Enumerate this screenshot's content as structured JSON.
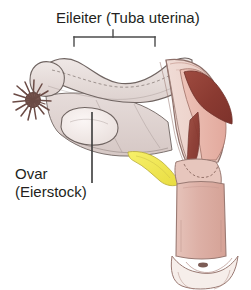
{
  "figure": {
    "width": 251,
    "height": 290,
    "background": "#ffffff",
    "language": "de"
  },
  "labels": {
    "tube": {
      "text": "Eileiter (Tuba uterina)",
      "term": "Eileiter",
      "latin": "Tuba uterina",
      "color": "#231f20",
      "x": 56,
      "y": 9,
      "font_size_px": 15
    },
    "ovary": {
      "line1": "Ovar",
      "line2": "(Eierstock)",
      "term": "Ovar",
      "german": "Eierstock",
      "color": "#231f20",
      "x": 15,
      "y": 165,
      "font_size_px": 15
    }
  },
  "leaders": {
    "tube_bracket": {
      "name": "span-bracket",
      "x_left": 74,
      "x_right": 155,
      "y_bar": 37,
      "tick_height": 9,
      "stem_x": 113,
      "stem_top": 30,
      "color": "#4b4b4b",
      "width_px": 1.4
    },
    "ovary_pointer": {
      "name": "leader-line",
      "x": 92,
      "y_top": 112,
      "y_bottom": 183,
      "color": "#3a3a3a",
      "width_px": 1.6
    }
  },
  "anatomy": {
    "parts": [
      {
        "name": "fallopian-tube",
        "label": "Eileiter (Tuba uterina)",
        "fill": "#e4dad8",
        "stroke": "#6f6461"
      },
      {
        "name": "fimbriae",
        "label": "Fimbrien",
        "fill": "#7c5c55",
        "stroke": "#5d433d"
      },
      {
        "name": "ovary",
        "label": "Ovar (Eierstock)",
        "fill": "#f0e8e6",
        "stroke": "#6f6461"
      },
      {
        "name": "broad-ligament",
        "label": "Ligamentum latum",
        "fill": "#ddd0ce",
        "stroke": "#6f6461"
      },
      {
        "name": "uterus-body",
        "label": "Uterus",
        "fill": "#eccfc7",
        "stroke": "#8d6f69"
      },
      {
        "name": "uterine-cavity",
        "label": "Cavitas uteri",
        "fill": "#8f3f36",
        "stroke": "#6d2e28"
      },
      {
        "name": "endometrium",
        "label": "Endometrium",
        "fill": "#e8b9ae",
        "stroke": "#a8796f"
      },
      {
        "name": "round-ligament",
        "label": "Ligamentum teres uteri",
        "fill": "#f2e85c",
        "stroke": "#b8ab36"
      },
      {
        "name": "cervix",
        "label": "Cervix uteri",
        "fill": "#e7c6bd",
        "stroke": "#9a7a73"
      },
      {
        "name": "vagina",
        "label": "Vagina",
        "fill": "#dfb5ac",
        "stroke": "#9a7a73"
      },
      {
        "name": "vaginal-fornix",
        "label": "Fornix vaginae",
        "fill": "#f6eeea",
        "stroke": "#9a7a73"
      }
    ]
  }
}
